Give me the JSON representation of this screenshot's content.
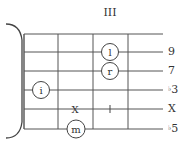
{
  "diagram": {
    "fret_position": "III",
    "strings": [
      {
        "y": 34,
        "label": ""
      },
      {
        "y": 52,
        "label": "9"
      },
      {
        "y": 71,
        "label": "7"
      },
      {
        "y": 90,
        "label": "♭3"
      },
      {
        "y": 109,
        "label": "X"
      },
      {
        "y": 129,
        "label": "♭5"
      }
    ],
    "right_labels": {
      "s2": "9",
      "s3": "7",
      "s4_flat": "♭",
      "s4_num": "3",
      "s5": "X",
      "s6_flat": "♭",
      "s6_num": "5"
    },
    "frets_x": [
      24,
      58,
      93,
      128
    ],
    "string_end_x": 163,
    "finger_markers": [
      {
        "finger": "i",
        "cx": 41,
        "cy": 90
      },
      {
        "finger": "l",
        "cx": 110,
        "cy": 52
      },
      {
        "finger": "r",
        "cx": 110,
        "cy": 71
      },
      {
        "finger": "m",
        "cx": 76,
        "cy": 129
      }
    ],
    "mute_markers": [
      {
        "symbol": "X",
        "x": 75,
        "y": 109
      }
    ],
    "tick_markers": [
      {
        "symbol": "|",
        "x": 110,
        "y": 109
      }
    ],
    "line_color": "#555555",
    "text_color": "#333333"
  }
}
